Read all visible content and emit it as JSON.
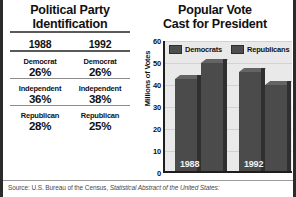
{
  "left_panel": {
    "title_line1": "Political Party",
    "title_line2": "Identification",
    "columns": [
      "1988",
      "1992"
    ],
    "rows": [
      {
        "party": "Democrat",
        "values": [
          "26%",
          "26%"
        ]
      },
      {
        "party": "Independent",
        "values": [
          "36%",
          "38%"
        ]
      },
      {
        "party": "Republican",
        "values": [
          "28%",
          "25%"
        ]
      }
    ]
  },
  "right_panel": {
    "title_line1": "Popular Vote",
    "title_line2": "Cast for President"
  },
  "chart_data": {
    "type": "bar",
    "title": "Popular Vote Cast for President",
    "categories": [
      "1988",
      "1992"
    ],
    "series": [
      {
        "name": "Democrats",
        "values": [
          42,
          45
        ]
      },
      {
        "name": "Republicans",
        "values": [
          49,
          39
        ]
      }
    ],
    "xlabel": "",
    "ylabel": "Millions of Votes",
    "ylim": [
      0,
      60
    ],
    "yticks": [
      60,
      50,
      40,
      30,
      20,
      10,
      0
    ],
    "ytick_labels": [
      "60",
      "50",
      "40",
      "30",
      "20",
      "10",
      "0"
    ],
    "grid": true,
    "legend_position": "top",
    "bar_color": "#4b4b4b",
    "plot_background": "#e9e9e9"
  },
  "source": {
    "label": "Source: U.S. Bureau of the Census,",
    "title": "Statistical Abstract of the United States:"
  }
}
